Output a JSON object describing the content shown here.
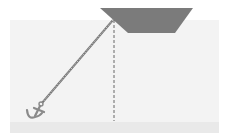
{
  "diagram": {
    "title": "",
    "elements": {
      "boat": {
        "shape": "trapezoid",
        "color": "#7b7b7b"
      },
      "water": {
        "color": "#f3f3f3"
      },
      "seabed": {
        "color": "#e9e9e9"
      },
      "anchor_chain": {
        "color": "#666666"
      },
      "depth_line": {
        "style": "dashed",
        "color": "#666666"
      },
      "anchor": {
        "icon": "anchor-icon",
        "color": "#8a8a8a"
      }
    }
  }
}
